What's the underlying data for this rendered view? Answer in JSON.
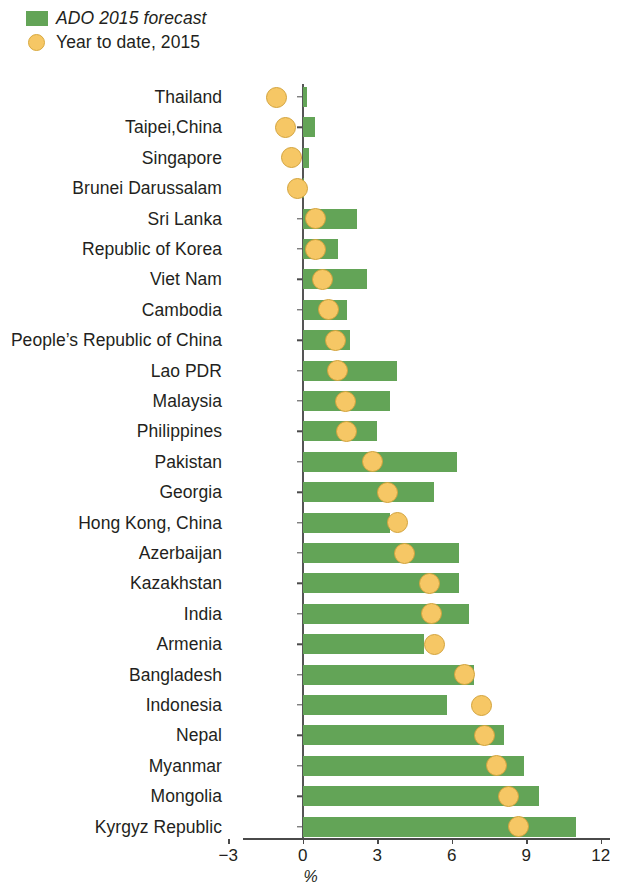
{
  "legend": {
    "items": [
      {
        "label": "ADO 2015 forecast",
        "marker": "square-green",
        "color": "#63a457",
        "style": "italic"
      },
      {
        "label": "Year to date, 2015",
        "marker": "circle-orange",
        "color": "#f6c765",
        "style": "normal"
      }
    ]
  },
  "axis": {
    "x_title": "%",
    "ticks": [
      "-3",
      "0",
      "3",
      "6",
      "9",
      "12"
    ],
    "tick_values": [
      -3,
      0,
      3,
      6,
      9,
      12
    ]
  },
  "chart_data": {
    "type": "bar",
    "orientation": "horizontal",
    "title": "",
    "xlabel": "%",
    "ylabel": "",
    "xlim": [
      -3,
      12
    ],
    "grid": false,
    "legend_position": "top-left",
    "categories": [
      "Thailand",
      "Taipei,China",
      "Singapore",
      "Brunei Darussalam",
      "Sri Lanka",
      "Republic of Korea",
      "Viet Nam",
      "Cambodia",
      "People’s Republic of China",
      "Lao PDR",
      "Malaysia",
      "Philippines",
      "Pakistan",
      "Georgia",
      "Hong Kong, China",
      "Azerbaijan",
      "Kazakhstan",
      "India",
      "Armenia",
      "Bangladesh",
      "Indonesia",
      "Nepal",
      "Myanmar",
      "Mongolia",
      "Kyrgyz Republic"
    ],
    "series": [
      {
        "name": "ADO 2015 forecast",
        "type": "bar",
        "color": "#63a457",
        "values": [
          0.15,
          0.5,
          0.25,
          0.0,
          2.2,
          1.4,
          2.6,
          1.8,
          1.9,
          3.8,
          3.5,
          3.0,
          6.2,
          5.3,
          3.5,
          6.3,
          6.3,
          6.7,
          4.9,
          6.9,
          5.8,
          8.1,
          8.9,
          9.5,
          11.0
        ]
      },
      {
        "name": "Year to date, 2015",
        "type": "scatter",
        "color": "#f6c765",
        "values": [
          -1.05,
          -0.7,
          -0.45,
          -0.2,
          0.5,
          0.5,
          0.8,
          1.05,
          1.3,
          1.4,
          1.7,
          1.75,
          2.8,
          3.4,
          3.8,
          4.1,
          5.1,
          5.2,
          5.3,
          6.5,
          7.2,
          7.3,
          7.8,
          8.3,
          8.7
        ]
      }
    ]
  }
}
